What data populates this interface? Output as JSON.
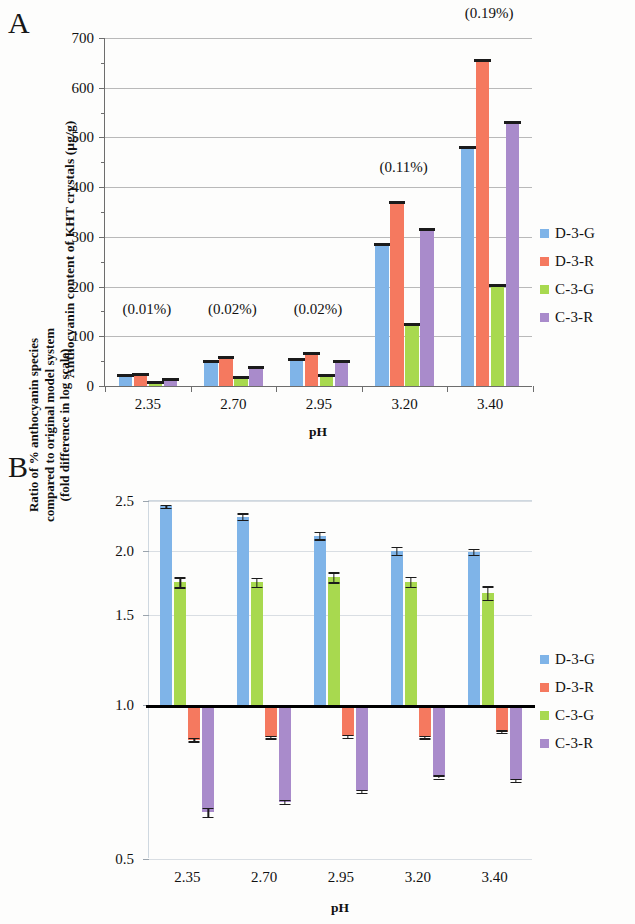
{
  "figure": {
    "panel_a_letter": "A",
    "panel_b_letter": "B"
  },
  "colors": {
    "d3g": "#7FB4E8",
    "d3r": "#F5795F",
    "c3g": "#A8D94F",
    "c3r": "#A98BCB",
    "gridline": "#b9b9b9",
    "axis": "#6d6d6d",
    "text": "#111111"
  },
  "legend": {
    "items": [
      {
        "label": "D-3-G",
        "color": "#7FB4E8"
      },
      {
        "label": "D-3-R",
        "color": "#F5795F"
      },
      {
        "label": "C-3-G",
        "color": "#A8D94F"
      },
      {
        "label": "C-3-R",
        "color": "#A98BCB"
      }
    ]
  },
  "chart_data": [
    {
      "panel": "A",
      "type": "bar",
      "title": "",
      "xlabel": "pH",
      "ylabel": "Anthocyanin content of KHT crystals (µg/g)",
      "categories": [
        "2.35",
        "2.70",
        "2.95",
        "3.20",
        "3.40"
      ],
      "yticks": [
        0,
        100,
        200,
        300,
        400,
        500,
        600,
        700
      ],
      "ylim": [
        0,
        700
      ],
      "grid": true,
      "legend_position": "right",
      "series": [
        {
          "name": "D-3-G",
          "color": "#7FB4E8",
          "values": [
            25,
            53,
            57,
            287,
            483
          ],
          "errors": [
            3,
            4,
            4,
            5,
            5
          ]
        },
        {
          "name": "D-3-R",
          "color": "#F5795F",
          "values": [
            27,
            60,
            69,
            373,
            657
          ],
          "errors": [
            3,
            4,
            5,
            5,
            5
          ]
        },
        {
          "name": "C-3-G",
          "color": "#A8D94F",
          "values": [
            10,
            20,
            24,
            127,
            206
          ],
          "errors": [
            2,
            3,
            3,
            4,
            4
          ]
        },
        {
          "name": "C-3-R",
          "color": "#A98BCB",
          "values": [
            17,
            41,
            52,
            317,
            533
          ],
          "errors": [
            2,
            3,
            4,
            4,
            5
          ]
        }
      ],
      "annotations": [
        {
          "text": "(0.01%)",
          "category": "2.35",
          "value": 135
        },
        {
          "text": "(0.02%)",
          "category": "2.70",
          "value": 135
        },
        {
          "text": "(0.02%)",
          "category": "2.95",
          "value": 135
        },
        {
          "text": "(0.11%)",
          "category": "3.20",
          "value": 420
        },
        {
          "text": "(0.19%)",
          "category": "3.40",
          "value": 730
        }
      ]
    },
    {
      "panel": "B",
      "type": "bar",
      "title": "",
      "xlabel": "pH",
      "ylabel_lines": [
        "Ratio of % anthocyanin species",
        "compared to original model system",
        "(fold difference in log scale)"
      ],
      "categories": [
        "2.35",
        "2.70",
        "2.95",
        "3.20",
        "3.40"
      ],
      "yticks": [
        0.5,
        1.0,
        1.5,
        2.0,
        2.5
      ],
      "ylim": [
        0.5,
        2.5
      ],
      "yscale": "log",
      "baseline": 1.0,
      "grid": true,
      "legend_position": "right",
      "series": [
        {
          "name": "D-3-G",
          "color": "#7FB4E8",
          "values": [
            2.44,
            2.33,
            2.14,
            2.0,
            1.99
          ],
          "errors": [
            0.015,
            0.035,
            0.035,
            0.035,
            0.025
          ]
        },
        {
          "name": "D-3-R",
          "color": "#F5795F",
          "values": [
            0.855,
            0.865,
            0.868,
            0.865,
            0.886
          ],
          "errors": [
            0.006,
            0.005,
            0.005,
            0.005,
            0.005
          ]
        },
        {
          "name": "C-3-G",
          "color": "#A8D94F",
          "values": [
            1.735,
            1.735,
            1.775,
            1.74,
            1.655
          ],
          "errors": [
            0.04,
            0.035,
            0.04,
            0.04,
            0.05
          ]
        },
        {
          "name": "C-3-R",
          "color": "#A98BCB",
          "values": [
            0.617,
            0.646,
            0.678,
            0.723,
            0.713
          ],
          "errors": [
            0.012,
            0.006,
            0.005,
            0.005,
            0.005
          ]
        }
      ]
    }
  ]
}
